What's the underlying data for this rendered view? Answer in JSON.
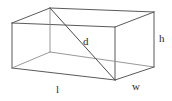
{
  "figure": {
    "name": "rectangular-prism-with-space-diagonal",
    "shape_type": "rectangular prism",
    "projection": "oblique",
    "background_color": "#ffffff",
    "edge_color": "#5a5a5a",
    "hidden_edge_color": "#8c8c8c",
    "diagonal_color": "#4a4a4a",
    "label_color": "#2b2b2b",
    "width_px": 172,
    "height_px": 101
  },
  "labels": {
    "length": "l",
    "width": "w",
    "height": "h",
    "diagonal": "d"
  },
  "geometry": {
    "front_top_left": [
      12,
      23
    ],
    "front_top_right": [
      115,
      27
    ],
    "front_bottom_right": [
      115,
      80
    ],
    "front_bottom_left": [
      12,
      68
    ],
    "back_top_left": [
      50,
      8
    ],
    "back_top_right": [
      154,
      12
    ],
    "back_bottom_right": [
      154,
      67
    ],
    "back_bottom_left": [
      50,
      52
    ],
    "diagonal_from": [
      50,
      8
    ],
    "diagonal_to": [
      115,
      80
    ]
  }
}
